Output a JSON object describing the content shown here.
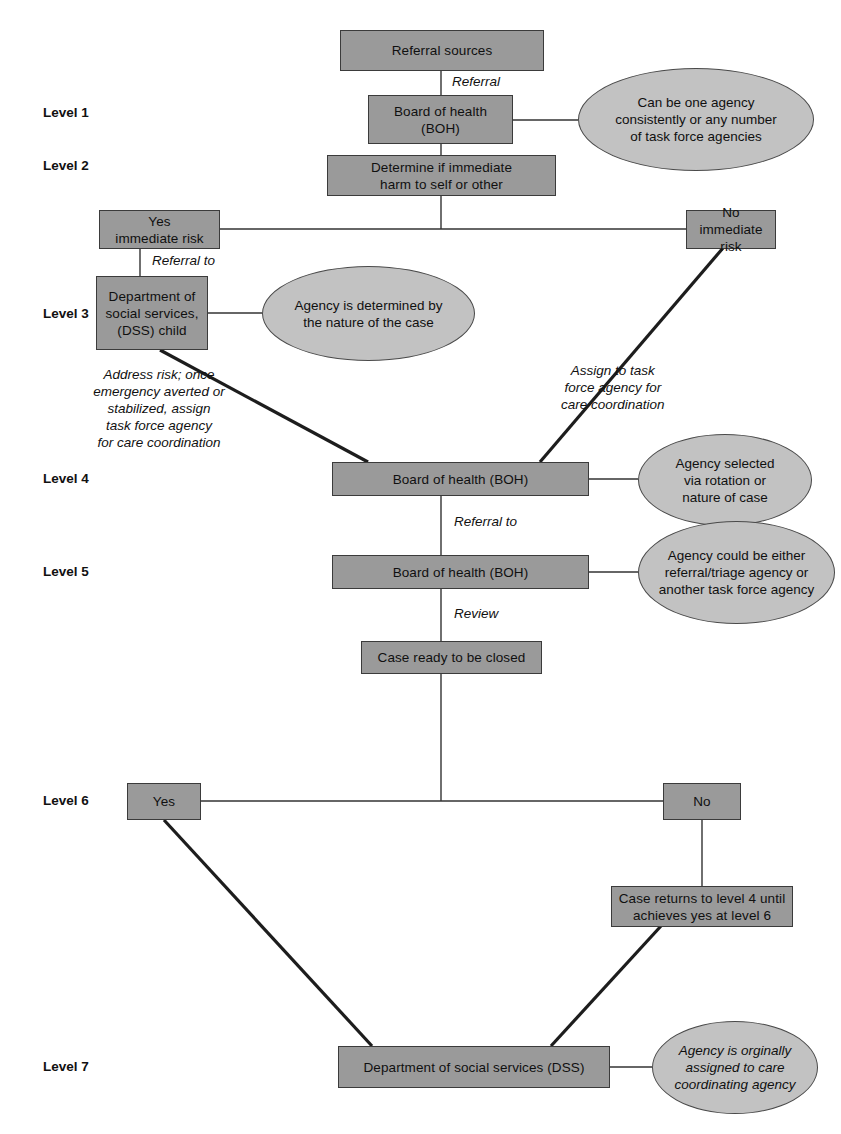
{
  "diagram": {
    "colors": {
      "node_fill": "#9a9a9a",
      "node_stroke": "#3b3b3b",
      "note_fill": "#c2c2c2",
      "note_stroke": "#4a4a4a",
      "line": "#333333",
      "text": "#101010",
      "background": "#ffffff"
    }
  },
  "levels": [
    {
      "id": "level-1",
      "label": "Level 1"
    },
    {
      "id": "level-2",
      "label": "Level 2"
    },
    {
      "id": "level-3",
      "label": "Level 3"
    },
    {
      "id": "level-4",
      "label": "Level 4"
    },
    {
      "id": "level-5",
      "label": "Level 5"
    },
    {
      "id": "level-6",
      "label": "Level 6"
    },
    {
      "id": "level-7",
      "label": "Level 7"
    }
  ],
  "nodes": [
    {
      "id": "referral-sources",
      "text": "Referral sources"
    },
    {
      "id": "boh-level-1",
      "text": "Board of health\n(BOH)"
    },
    {
      "id": "determine-harm",
      "text": "Determine if immediate\nharm to self or other"
    },
    {
      "id": "yes-immediate-risk",
      "text": "Yes\nimmediate risk"
    },
    {
      "id": "no-immediate-risk",
      "text": "No\nimmediate risk"
    },
    {
      "id": "dss-child",
      "text": "Department of\nsocial services,\n(DSS) child"
    },
    {
      "id": "boh-level-4",
      "text": "Board of health (BOH)"
    },
    {
      "id": "boh-level-5",
      "text": "Board of health (BOH)"
    },
    {
      "id": "case-ready-closed",
      "text": "Case ready to be closed"
    },
    {
      "id": "yes-level-6",
      "text": "Yes"
    },
    {
      "id": "no-level-6",
      "text": "No"
    },
    {
      "id": "case-returns",
      "text": "Case returns to level 4 until\nachieves yes at level 6"
    },
    {
      "id": "dss-level-7",
      "text": "Department of social services (DSS)"
    }
  ],
  "notes": [
    {
      "id": "note-one-agency",
      "text": "Can be one agency\nconsistently or any number\nof task force agencies"
    },
    {
      "id": "note-nature-case",
      "text": "Agency is determined by\nthe nature of the case"
    },
    {
      "id": "note-rotation",
      "text": "Agency selected\nvia rotation or\nnature of case"
    },
    {
      "id": "note-either",
      "text": "Agency could be either\nreferral/triage agency or\nanother task force agency"
    },
    {
      "id": "note-originally",
      "text": "Agency is orginally\nassigned to care\ncoordinating agency"
    }
  ],
  "edge_labels": [
    {
      "id": "edge-referral",
      "text": "Referral"
    },
    {
      "id": "edge-referral-to-level-3",
      "text": "Referral to"
    },
    {
      "id": "edge-assign-task-force",
      "text": "Assign to task\nforce agency for\ncare coordination"
    },
    {
      "id": "edge-address-risk",
      "text": "Address risk; once\nemergency averted or\nstabilized, assign\ntask force agency\nfor care coordination"
    },
    {
      "id": "edge-referral-to-level-5",
      "text": "Referral to"
    },
    {
      "id": "edge-review",
      "text": "Review"
    }
  ]
}
